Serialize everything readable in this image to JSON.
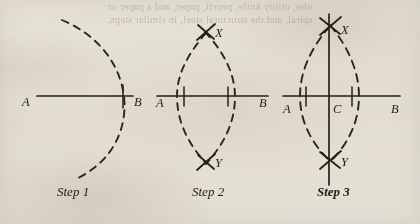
{
  "figure": {
    "kind": "geometric-construction-diagram",
    "background_color": "#f2efe9",
    "ink_color": "#25211a",
    "bleed_through_text": {
      "note": "faint mirrored show-through from reverse side of page, not legible forward text",
      "line_1": "uler, utility knife, pencil, paper, and a paper or",
      "line_2": "spiral, and the structural steel, in similar steps."
    },
    "steps": [
      {
        "id": "step-1",
        "caption": "Step 1",
        "caption_bold": false,
        "points": [
          {
            "label": "A",
            "x": 27,
            "y": 101
          },
          {
            "label": "B",
            "x": 137,
            "y": 101
          }
        ],
        "line": {
          "from_x": 37,
          "to_x": 133,
          "y": 96
        },
        "tick": {
          "x": 123,
          "y_top": 86,
          "y_bottom": 108
        },
        "arcs": [
          {
            "name": "arc-from-A",
            "center_x": 30,
            "center_y": 99,
            "radius": 93,
            "start_deg": -55,
            "end_deg": 55
          }
        ]
      },
      {
        "id": "step-2",
        "caption": "Step 2",
        "caption_bold": false,
        "points": [
          {
            "label": "A",
            "x": 161,
            "y": 101
          },
          {
            "label": "B",
            "x": 263,
            "y": 101
          },
          {
            "label": "X",
            "x": 217,
            "y": 34
          },
          {
            "label": "Y",
            "x": 217,
            "y": 163
          }
        ],
        "line": {
          "from_x": 157,
          "to_x": 268,
          "y": 96
        },
        "ticks": [
          {
            "x": 184,
            "y_top": 88,
            "y_bottom": 106
          },
          {
            "x": 228,
            "y_top": 88,
            "y_bottom": 106
          }
        ],
        "arcs": [
          {
            "name": "arc-from-A",
            "center_x": 163,
            "center_y": 96,
            "radius": 93,
            "bulge": "right"
          },
          {
            "name": "arc-from-B",
            "center_x": 262,
            "center_y": 96,
            "radius": 93,
            "bulge": "left"
          }
        ],
        "intersections": [
          {
            "name": "cross-mark-X",
            "x": 206,
            "y": 31
          },
          {
            "name": "cross-mark-Y",
            "x": 206,
            "y": 162
          }
        ]
      },
      {
        "id": "step-3",
        "caption": "Step 3",
        "caption_bold": true,
        "points": [
          {
            "label": "A",
            "x": 288,
            "y": 107
          },
          {
            "label": "B",
            "x": 396,
            "y": 107
          },
          {
            "label": "C",
            "x": 336,
            "y": 107
          },
          {
            "label": "X",
            "x": 345,
            "y": 30
          },
          {
            "label": "Y",
            "x": 345,
            "y": 161
          }
        ],
        "line": {
          "from_x": 283,
          "to_x": 400,
          "y": 96
        },
        "ticks": [
          {
            "x": 306,
            "y_top": 88,
            "y_bottom": 106
          },
          {
            "x": 352,
            "y_top": 88,
            "y_bottom": 106
          }
        ],
        "perpendicular": {
          "x": 329,
          "y_top": 14,
          "y_bottom": 185
        },
        "arcs": [
          {
            "name": "arc-from-A",
            "center_x": 285,
            "center_y": 96,
            "radius": 95,
            "bulge": "right"
          },
          {
            "name": "arc-from-B",
            "center_x": 387,
            "center_y": 96,
            "radius": 95,
            "bulge": "left"
          }
        ],
        "intersections": [
          {
            "name": "cross-mark-X",
            "x": 330,
            "y": 25
          },
          {
            "name": "cross-mark-Y",
            "x": 330,
            "y": 160
          }
        ]
      }
    ],
    "captions": [
      {
        "text": "Step 1",
        "x": 57,
        "y": 192,
        "bold": false
      },
      {
        "text": "Step 2",
        "x": 192,
        "y": 192,
        "bold": false
      },
      {
        "text": "Step 3",
        "x": 317,
        "y": 192,
        "bold": true
      }
    ]
  }
}
